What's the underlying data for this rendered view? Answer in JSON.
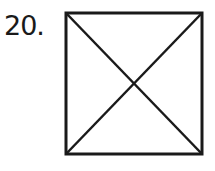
{
  "problem": {
    "number_label": "20."
  },
  "figure": {
    "shape": "square-with-diagonals",
    "stroke_color": "#1a1a1a",
    "square": {
      "x": 65,
      "y": 12,
      "width": 138,
      "height": 143
    },
    "diagonals": 2
  }
}
